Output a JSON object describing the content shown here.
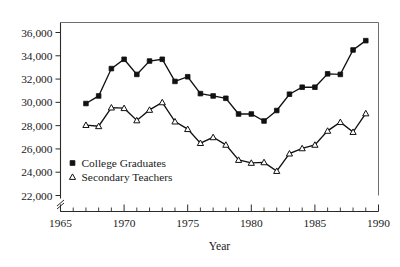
{
  "chart_data": {
    "type": "line",
    "title": "",
    "xlabel": "Year",
    "ylabel": "",
    "xlim": [
      1965,
      1990
    ],
    "ylim": [
      22000,
      36000
    ],
    "y_axis_break": true,
    "grid": false,
    "legend_position": "inside-lower-left",
    "x_ticks_major": [
      1965,
      1970,
      1975,
      1980,
      1985,
      1990
    ],
    "x_tick_labels": [
      "1965",
      "1970",
      "1975",
      "1980",
      "1985",
      "1990"
    ],
    "x_ticks_minor_step": 1,
    "y_ticks": [
      22000,
      24000,
      26000,
      28000,
      30000,
      32000,
      34000,
      36000
    ],
    "y_tick_labels": [
      "22,000",
      "24,000",
      "26,000",
      "28,000",
      "30,000",
      "32,000",
      "34,000",
      "36,000"
    ],
    "x": [
      1967,
      1968,
      1969,
      1970,
      1971,
      1972,
      1973,
      1974,
      1975,
      1976,
      1977,
      1978,
      1979,
      1980,
      1981,
      1982,
      1983,
      1984,
      1985,
      1986,
      1987,
      1988,
      1989
    ],
    "series": [
      {
        "name": "College Graduates",
        "marker": "filled-square",
        "color": "#111111",
        "values": [
          29900,
          30550,
          32900,
          33700,
          32400,
          33550,
          33700,
          31800,
          32200,
          30750,
          30550,
          30350,
          29000,
          29000,
          28400,
          29300,
          30700,
          31300,
          31300,
          32450,
          32400,
          34500,
          35300
        ]
      },
      {
        "name": "Secondary Teachers",
        "marker": "open-triangle",
        "color": "#111111",
        "values": [
          28050,
          27950,
          29550,
          29500,
          28450,
          29350,
          30000,
          28350,
          27700,
          26500,
          27000,
          26350,
          25050,
          24800,
          24850,
          24100,
          25600,
          26050,
          26350,
          27550,
          28300,
          27450,
          29050
        ]
      }
    ]
  },
  "legend": {
    "entries": [
      {
        "label": "College Graduates",
        "marker": "filled-square"
      },
      {
        "label": "Secondary Teachers",
        "marker": "open-triangle"
      }
    ]
  },
  "axis": {
    "x_title": "Year"
  }
}
